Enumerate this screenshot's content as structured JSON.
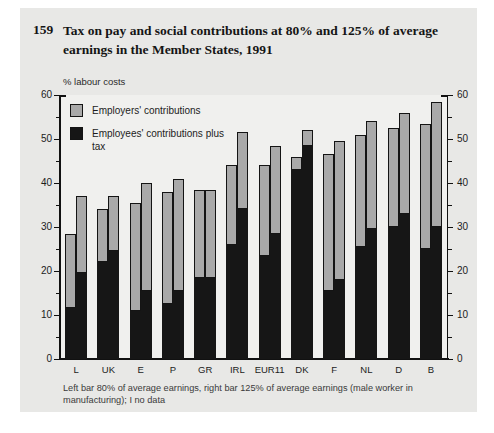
{
  "header": {
    "number": "159",
    "title": "Tax on pay and social contributions at 80% and 125% of average earnings in the Member States, 1991"
  },
  "legend": {
    "items": [
      {
        "label": "Employers' contributions",
        "color": "#a9a9a9"
      },
      {
        "label": "Employees' contributions plus tax",
        "color": "#161616"
      }
    ]
  },
  "footnote": "Left bar 80% of average earnings, right bar 125% of average earnings (male worker in manufacturing); I no data",
  "chart_data": {
    "type": "bar",
    "stacked": true,
    "unit_label": "% labour costs",
    "title": "Tax on pay and social contributions at 80% and 125% of average earnings in the Member States, 1991",
    "ylim": [
      0,
      60
    ],
    "yticks": [
      0,
      10,
      20,
      30,
      40,
      50,
      60
    ],
    "ytick_minor_step": 5,
    "y_axis_sides": "both",
    "grid": false,
    "legend_position": "inside-top-left",
    "categories": [
      "L",
      "UK",
      "E",
      "P",
      "GR",
      "IRL",
      "EUR11",
      "DK",
      "F",
      "NL",
      "D",
      "B"
    ],
    "bars_per_category": [
      "80% of average earnings",
      "125% of average earnings"
    ],
    "series": [
      {
        "name": "Employees' contributions plus tax",
        "stack_order": "bottom",
        "color": "#161616",
        "at_80pct": [
          11.5,
          22.0,
          11.0,
          12.5,
          18.5,
          26.0,
          23.5,
          43.0,
          15.5,
          25.5,
          30.0,
          25.0
        ],
        "at_125pct": [
          19.5,
          24.5,
          15.5,
          15.5,
          18.5,
          34.0,
          28.5,
          48.5,
          18.0,
          29.5,
          33.0,
          30.0
        ]
      },
      {
        "name": "Employers' contributions",
        "stack_order": "top",
        "color": "#a9a9a9",
        "at_80pct": [
          17.0,
          12.0,
          24.5,
          25.5,
          20.0,
          18.0,
          20.5,
          3.0,
          31.0,
          25.5,
          22.5,
          28.5
        ],
        "at_125pct": [
          17.5,
          12.5,
          24.5,
          25.5,
          20.0,
          17.5,
          20.0,
          3.5,
          31.5,
          24.5,
          23.0,
          28.5
        ]
      }
    ],
    "colors": {
      "card_bg": "#e8e8e6",
      "plot_bg": "#f0f0ee",
      "axis": "#111111",
      "bar_outline": "#141414"
    }
  }
}
